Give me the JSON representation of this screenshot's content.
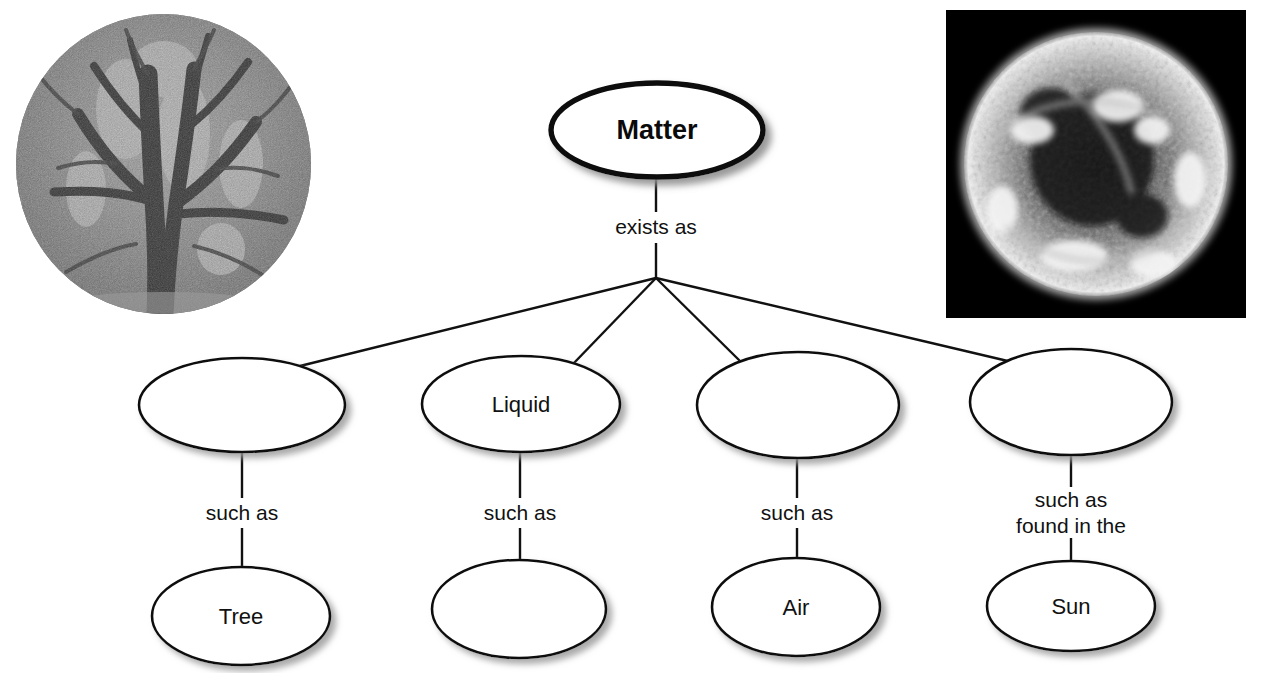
{
  "diagram": {
    "type": "concept-map",
    "root": {
      "label": "Matter",
      "link_to_children": "exists as"
    },
    "level2": [
      {
        "label": "",
        "link_label": "such as"
      },
      {
        "label": "Liquid",
        "link_label": "such as"
      },
      {
        "label": "",
        "link_label": "such as"
      },
      {
        "label": "",
        "link_label": "such as\nfound in the"
      }
    ],
    "level3": [
      {
        "label": "Tree"
      },
      {
        "label": ""
      },
      {
        "label": "Air"
      },
      {
        "label": "Sun"
      }
    ],
    "link_labels": {
      "root_children": "exists as",
      "such_as": "such as",
      "such_as_found_line1": "such as",
      "such_as_found_line2": "found in the"
    },
    "colors": {
      "stroke": "#111111",
      "root_stroke": "#0a0a0a",
      "fill": "#ffffff",
      "text": "#111111",
      "background": "#ffffff",
      "photo_frame": "#000000"
    }
  },
  "images": {
    "tree_photo": {
      "name": "tree-photo",
      "shape": "circle",
      "description": "Black and white photograph of a large tree with spreading branches"
    },
    "sun_photo": {
      "name": "sun-photo",
      "shape": "square",
      "description": "Black and white photograph of the Sun showing solar surface activity"
    }
  }
}
